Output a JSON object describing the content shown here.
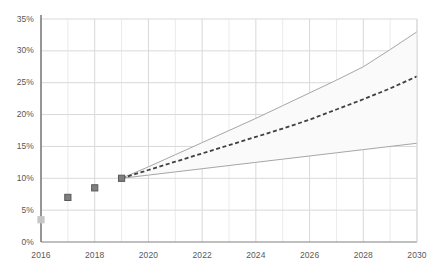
{
  "chart_data": {
    "type": "line",
    "title": "",
    "subtitle": "",
    "xlabel": "",
    "ylabel": "",
    "xlim": [
      2016,
      2030
    ],
    "ylim": [
      0,
      35
    ],
    "grid": true,
    "legend_position": "none",
    "y_ticks": [
      "0%",
      "5%",
      "10%",
      "15%",
      "20%",
      "25%",
      "30%",
      "35%"
    ],
    "y_tick_values": [
      0,
      5,
      10,
      15,
      20,
      25,
      30,
      35
    ],
    "x_ticks": [
      "2016",
      "2018",
      "2020",
      "2022",
      "2024",
      "2026",
      "2028",
      "2030"
    ],
    "x_tick_values": [
      2016,
      2018,
      2020,
      2022,
      2024,
      2026,
      2028,
      2030
    ],
    "series": [
      {
        "name": "Historical",
        "style": "markers",
        "color": "#7f7f7f",
        "x": [
          2016,
          2017,
          2018,
          2019
        ],
        "values": [
          3.5,
          7.0,
          8.5,
          10.0
        ]
      },
      {
        "name": "Central projection",
        "style": "dashed",
        "color": "#404040",
        "x": [
          2019,
          2020,
          2021,
          2022,
          2023,
          2024,
          2025,
          2026,
          2027,
          2028,
          2029,
          2030
        ],
        "values": [
          10.0,
          11.3,
          12.6,
          13.9,
          15.2,
          16.5,
          17.8,
          19.2,
          20.8,
          22.4,
          24.1,
          26.0
        ]
      },
      {
        "name": "Upper bound",
        "style": "solid",
        "color": "#a6a6a6",
        "x": [
          2019,
          2020,
          2021,
          2022,
          2023,
          2024,
          2025,
          2026,
          2027,
          2028,
          2029,
          2030
        ],
        "values": [
          10.0,
          11.8,
          13.7,
          15.6,
          17.5,
          19.4,
          21.4,
          23.4,
          25.4,
          27.5,
          30.2,
          33.0
        ]
      },
      {
        "name": "Lower bound",
        "style": "solid",
        "color": "#a6a6a6",
        "x": [
          2019,
          2020,
          2021,
          2022,
          2023,
          2024,
          2025,
          2026,
          2027,
          2028,
          2029,
          2030
        ],
        "values": [
          10.0,
          10.5,
          11.0,
          11.5,
          12.0,
          12.5,
          13.0,
          13.5,
          14.0,
          14.5,
          15.0,
          15.5
        ]
      }
    ],
    "band": {
      "name": "Forecast range",
      "fill": "#fafafa",
      "between": [
        "Upper bound",
        "Lower bound"
      ]
    },
    "colors": {
      "grid_minor": "#ebebeb",
      "grid_major": "#d9d9d9",
      "axis": "#808080",
      "marker": "#7f7f7f",
      "marker_edge": "#595959",
      "tick_text": "#595959"
    }
  }
}
